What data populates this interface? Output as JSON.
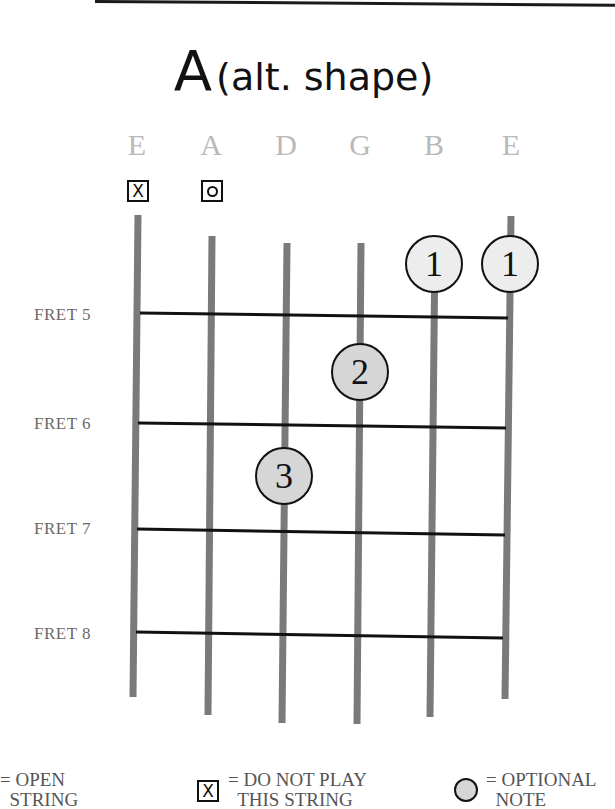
{
  "title": {
    "chord": "A",
    "qualifier": "(alt. shape)"
  },
  "strings": [
    {
      "name": "E",
      "x": 137,
      "marker": "X"
    },
    {
      "name": "A",
      "x": 211,
      "marker": "O"
    },
    {
      "name": "D",
      "x": 286,
      "marker": null
    },
    {
      "name": "G",
      "x": 360,
      "marker": null
    },
    {
      "name": "B",
      "x": 434,
      "marker": null
    },
    {
      "name": "E",
      "x": 509,
      "marker": null
    }
  ],
  "frets": [
    {
      "label": "FRET 5",
      "y": 315
    },
    {
      "label": "FRET 6",
      "y": 425
    },
    {
      "label": "FRET 7",
      "y": 531
    },
    {
      "label": "FRET 8",
      "y": 634
    }
  ],
  "fingers": [
    {
      "finger": "1",
      "string": "B",
      "x": 434,
      "y": 264,
      "shade": "light"
    },
    {
      "finger": "1",
      "string": "E",
      "x": 510,
      "y": 264,
      "shade": "light"
    },
    {
      "finger": "2",
      "string": "G",
      "x": 360,
      "y": 372,
      "shade": "mid"
    },
    {
      "finger": "3",
      "string": "D",
      "x": 284,
      "y": 476,
      "shade": "mid"
    }
  ],
  "legend": {
    "open": "= OPEN\n  STRING",
    "mute_symbol": "X",
    "mute": "= DO NOT PLAY\n  THIS STRING",
    "optional": "= OPTIONAL\n  NOTE"
  },
  "colors": {
    "string": "#7a7a7a",
    "fret": "#111111",
    "string_name": "#b9b9b9",
    "finger_light": "#ededed",
    "finger_mid": "#d6d6d6"
  }
}
